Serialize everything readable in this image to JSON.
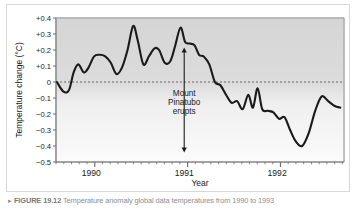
{
  "figure": {
    "caption_marker": "▸",
    "caption_label": "FIGURE 19.12",
    "caption_rest": "Temperature anomaly global data temperatures from 1990 to 1993"
  },
  "chart_data": {
    "type": "line",
    "title": "",
    "xlabel": "Year",
    "ylabel": "Temperature change (°C)",
    "ylim": [
      -0.5,
      0.4
    ],
    "xlim": [
      1989.62,
      1992.72
    ],
    "grid": false,
    "legend": "none",
    "zero_reference_line": {
      "value": 0,
      "style": "dashed",
      "color": "#555555"
    },
    "plot_background": "#d7d7d7",
    "line_color": "#1a1a1a",
    "y_ticks": [
      "+0.4",
      "+0.3",
      "+0.2",
      "+0.1",
      "0",
      "−0.1",
      "−0.2",
      "−0.3",
      "−0.4",
      "−0.5"
    ],
    "y_tick_values": [
      0.4,
      0.3,
      0.2,
      0.1,
      0,
      -0.1,
      -0.2,
      -0.3,
      -0.4,
      -0.5
    ],
    "x_ticks": [
      "1990",
      "1991",
      "1992"
    ],
    "x_tick_values": [
      1990,
      1991,
      1992
    ],
    "minor_tick_interval_years": 0.0833,
    "annotation": {
      "lines": [
        "Mount",
        "Pinatubo",
        "erupts"
      ],
      "x": 1991.0,
      "arrow_top_y": 0.215,
      "arrow_bottom_y": -0.44,
      "arrow_style": "double-headed-vertical"
    },
    "x": [
      1989.63,
      1989.7,
      1989.76,
      1989.81,
      1989.86,
      1989.92,
      1989.97,
      1990.03,
      1990.09,
      1990.15,
      1990.21,
      1990.27,
      1990.33,
      1990.39,
      1990.45,
      1990.5,
      1990.56,
      1990.62,
      1990.68,
      1990.73,
      1990.79,
      1990.85,
      1990.9,
      1990.96,
      1991.01,
      1991.06,
      1991.11,
      1991.16,
      1991.21,
      1991.27,
      1991.33,
      1991.39,
      1991.45,
      1991.51,
      1991.57,
      1991.63,
      1991.69,
      1991.74,
      1991.79,
      1991.84,
      1991.9,
      1991.96,
      1992.02,
      1992.08,
      1992.14,
      1992.2,
      1992.27,
      1992.34,
      1992.41,
      1992.48,
      1992.55,
      1992.62,
      1992.68
    ],
    "values": [
      0.0,
      -0.06,
      -0.05,
      0.06,
      0.11,
      0.06,
      0.09,
      0.16,
      0.17,
      0.16,
      0.12,
      0.05,
      0.09,
      0.2,
      0.35,
      0.26,
      0.11,
      0.16,
      0.21,
      0.2,
      0.12,
      0.13,
      0.22,
      0.34,
      0.25,
      0.24,
      0.23,
      0.17,
      0.16,
      0.11,
      0.0,
      -0.02,
      -0.08,
      -0.13,
      -0.12,
      -0.17,
      -0.08,
      -0.16,
      -0.04,
      -0.17,
      -0.18,
      -0.19,
      -0.23,
      -0.22,
      -0.3,
      -0.37,
      -0.4,
      -0.32,
      -0.18,
      -0.09,
      -0.12,
      -0.15,
      -0.16
    ]
  }
}
